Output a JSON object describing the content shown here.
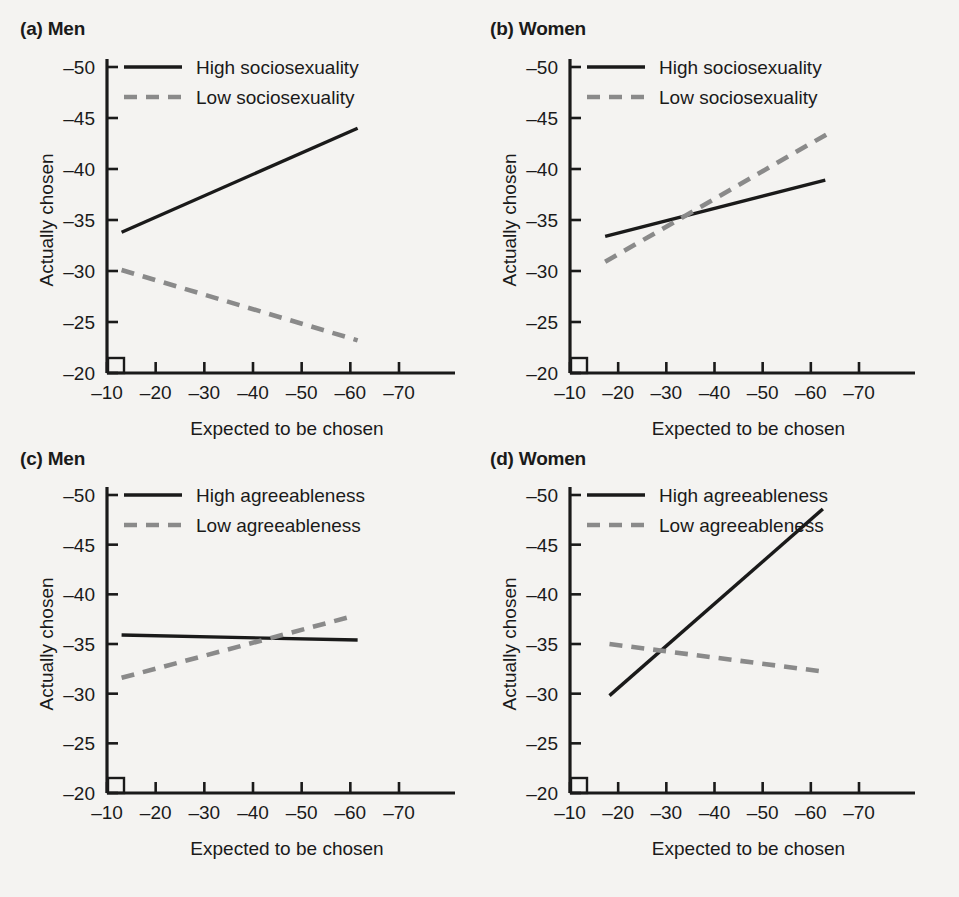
{
  "figure": {
    "background": "#f4f3f1",
    "line_color_solid": "#1a1a1a",
    "line_color_dashed": "#8a8a8a",
    "axis_color": "#1a1a1a"
  },
  "panels": [
    {
      "key": "a",
      "tag": "(a)",
      "title": "Men",
      "title_full": "(a) Men",
      "legend": [
        {
          "label": "High sociosexuality",
          "style": "solid"
        },
        {
          "label": "Low sociosexuality",
          "style": "dashed"
        }
      ]
    },
    {
      "key": "b",
      "tag": "(b)",
      "title": "Women",
      "title_full": "(b) Women",
      "legend": [
        {
          "label": "High sociosexuality",
          "style": "solid"
        },
        {
          "label": "Low sociosexuality",
          "style": "dashed"
        }
      ]
    },
    {
      "key": "c",
      "tag": "(c)",
      "title": "Men",
      "title_full": "(c) Men",
      "legend": [
        {
          "label": "High agreeableness",
          "style": "solid"
        },
        {
          "label": "Low agreeableness",
          "style": "dashed"
        }
      ]
    },
    {
      "key": "d",
      "tag": "(d)",
      "title": "Women",
      "title_full": "(d) Women",
      "legend": [
        {
          "label": "High agreeableness",
          "style": "solid"
        },
        {
          "label": "Low agreeableness",
          "style": "dashed"
        }
      ]
    }
  ],
  "chart_data": [
    {
      "type": "line",
      "panel": "a",
      "title": "(a) Men",
      "xlabel": "Expected to be chosen",
      "ylabel": "Actually chosen",
      "xticks": [
        "-10",
        "-20",
        "-30",
        "-40",
        "-50",
        "-60",
        "-70"
      ],
      "xtick_values": [
        -10,
        -20,
        -30,
        -40,
        -50,
        -60,
        -70
      ],
      "yticks": [
        "-20",
        "-25",
        "-30",
        "-35",
        "-40",
        "-45",
        "-50"
      ],
      "ytick_values": [
        -20,
        -25,
        -30,
        -35,
        -40,
        -45,
        -50
      ],
      "xlim": [
        -10,
        -70
      ],
      "ylim": [
        -20,
        -50
      ],
      "grid": false,
      "legend_position": "top-right-inside",
      "series": [
        {
          "name": "High sociosexuality",
          "style": "solid",
          "color": "#1a1a1a",
          "x": [
            -13.0,
            -61.5
          ],
          "y": [
            -33.8,
            -44.0
          ]
        },
        {
          "name": "Low sociosexuality",
          "style": "dashed",
          "color": "#8a8a8a",
          "x": [
            -13.0,
            -61.5
          ],
          "y": [
            -30.1,
            -23.2
          ]
        }
      ]
    },
    {
      "type": "line",
      "panel": "b",
      "title": "(b) Women",
      "xlabel": "Expected to be chosen",
      "ylabel": "Actually chosen",
      "xticks": [
        "-10",
        "-20",
        "-30",
        "-40",
        "-50",
        "-60",
        "-70"
      ],
      "xtick_values": [
        -10,
        -20,
        -30,
        -40,
        -50,
        -60,
        -70
      ],
      "yticks": [
        "-20",
        "-25",
        "-30",
        "-35",
        "-40",
        "-45",
        "-50"
      ],
      "ytick_values": [
        -20,
        -25,
        -30,
        -35,
        -40,
        -45,
        -50
      ],
      "xlim": [
        -10,
        -70
      ],
      "ylim": [
        -20,
        -50
      ],
      "grid": false,
      "legend_position": "top-right-inside",
      "series": [
        {
          "name": "High sociosexuality",
          "style": "solid",
          "color": "#1a1a1a",
          "x": [
            -17.3,
            -63.0
          ],
          "y": [
            -33.4,
            -38.9
          ]
        },
        {
          "name": "Low sociosexuality",
          "style": "dashed",
          "color": "#8a8a8a",
          "x": [
            -17.3,
            -63.3
          ],
          "y": [
            -30.9,
            -43.4
          ]
        }
      ]
    },
    {
      "type": "line",
      "panel": "c",
      "title": "(c) Men",
      "xlabel": "Expected to be chosen",
      "ylabel": "Actually chosen",
      "xticks": [
        "-10",
        "-20",
        "-30",
        "-40",
        "-50",
        "-60",
        "-70"
      ],
      "xtick_values": [
        -10,
        -20,
        -30,
        -40,
        -50,
        -60,
        -70
      ],
      "yticks": [
        "-20",
        "-25",
        "-30",
        "-35",
        "-40",
        "-45",
        "-50"
      ],
      "ytick_values": [
        -20,
        -25,
        -30,
        -35,
        -40,
        -45,
        -50
      ],
      "xlim": [
        -10,
        -70
      ],
      "ylim": [
        -20,
        -50
      ],
      "grid": false,
      "legend_position": "top-right-inside",
      "series": [
        {
          "name": "High agreeableness",
          "style": "solid",
          "color": "#1a1a1a",
          "x": [
            -13.0,
            -61.5
          ],
          "y": [
            -35.9,
            -35.4
          ]
        },
        {
          "name": "Low agreeableness",
          "style": "dashed",
          "color": "#8a8a8a",
          "x": [
            -13.0,
            -60.5
          ],
          "y": [
            -31.6,
            -37.8
          ]
        }
      ]
    },
    {
      "type": "line",
      "panel": "d",
      "title": "(d) Women",
      "xlabel": "Expected to be chosen",
      "ylabel": "Actually chosen",
      "xticks": [
        "-10",
        "-20",
        "-30",
        "-40",
        "-50",
        "-60",
        "-70"
      ],
      "xtick_values": [
        -10,
        -20,
        -30,
        -40,
        -50,
        -60,
        -70
      ],
      "yticks": [
        "-20",
        "-25",
        "-30",
        "-35",
        "-40",
        "-45",
        "-50"
      ],
      "ytick_values": [
        -20,
        -25,
        -30,
        -35,
        -40,
        -45,
        -50
      ],
      "xlim": [
        -10,
        -70
      ],
      "ylim": [
        -20,
        -50
      ],
      "grid": false,
      "legend_position": "top-right-inside",
      "series": [
        {
          "name": "High agreeableness",
          "style": "solid",
          "color": "#1a1a1a",
          "x": [
            -18.2,
            -62.5
          ],
          "y": [
            -29.8,
            -48.6
          ]
        },
        {
          "name": "Low agreeableness",
          "style": "dashed",
          "color": "#8a8a8a",
          "x": [
            -18.2,
            -63.0
          ],
          "y": [
            -35.0,
            -32.2
          ]
        }
      ]
    }
  ]
}
